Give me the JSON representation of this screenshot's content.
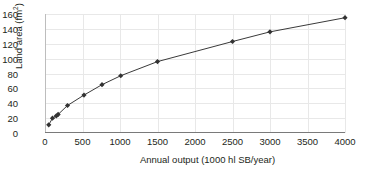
{
  "chart_data": {
    "type": "line",
    "title": "",
    "xlabel": "Annual output (1000 hl SB/year)",
    "ylabel": "Land area (fm",
    "ylabel_sup": "2",
    "ylabel_close": ")",
    "xlim": [
      0,
      4000
    ],
    "ylim": [
      0,
      160
    ],
    "xticks": [
      0,
      500,
      1000,
      1500,
      2000,
      2500,
      3000,
      3500,
      4000
    ],
    "yticks": [
      0,
      20,
      40,
      60,
      80,
      100,
      120,
      140,
      160
    ],
    "xtick_labels": [
      "0",
      "500",
      "1000",
      "1500",
      "2000",
      "2500",
      "3000",
      "3500",
      "4000"
    ],
    "ytick_labels": [
      "0",
      "20",
      "40",
      "60",
      "80",
      "100",
      "120",
      "140",
      "160"
    ],
    "grid": true,
    "legend": false,
    "marker": "diamond",
    "marker_color": "#333333",
    "line_color": "#3a3a3a",
    "series": [
      {
        "name": "Land area vs annual output",
        "x": [
          50,
          100,
          150,
          175,
          300,
          520,
          760,
          1010,
          1500,
          2500,
          3000,
          4000
        ],
        "y": [
          11,
          20,
          23,
          25,
          37,
          51,
          65,
          77,
          96,
          123,
          136,
          155
        ]
      }
    ]
  },
  "colors": {
    "grid": "#e8e8e8",
    "axis": "#7a7a7a",
    "text": "#231f20",
    "line": "#3a3a3a",
    "marker": "#333333",
    "background": "#ffffff"
  }
}
